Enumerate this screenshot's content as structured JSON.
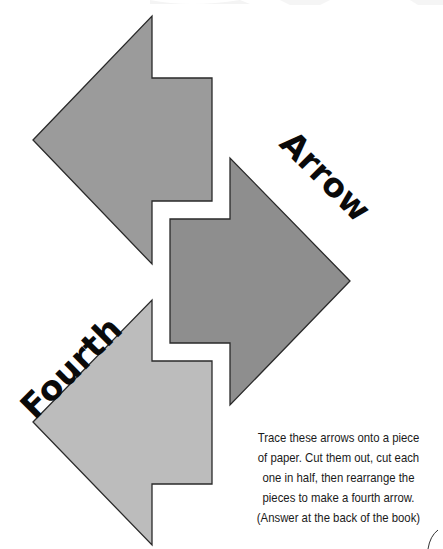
{
  "title_words": {
    "word1": "Arrow",
    "word2": "Fourth"
  },
  "caption": {
    "lines": [
      "Trace these arrows onto a piece",
      "of paper. Cut them out, cut each",
      "one in half, then rearrange the",
      "pieces to make a fourth arrow.",
      "(Answer at the back of the book)"
    ]
  },
  "arrows": [
    {
      "name": "top-left-arrow",
      "direction": "left",
      "fill": "#9b9b9b",
      "points": "33,140 152,16 152,78 212,78 212,201 152,201 152,264"
    },
    {
      "name": "middle-right-arrow",
      "direction": "right",
      "fill": "#8e8e8e",
      "points": "350,281 230,158 230,219 170,219 170,343 230,343 230,405"
    },
    {
      "name": "bottom-left-arrow",
      "direction": "left",
      "fill": "#bcbcbc",
      "points": "33,422 152,300 152,361 212,361 212,484 152,484 152,545"
    }
  ],
  "colors": {
    "outline": "#2a2a2a",
    "text": "#0a0a0a",
    "background": "#ffffff"
  }
}
